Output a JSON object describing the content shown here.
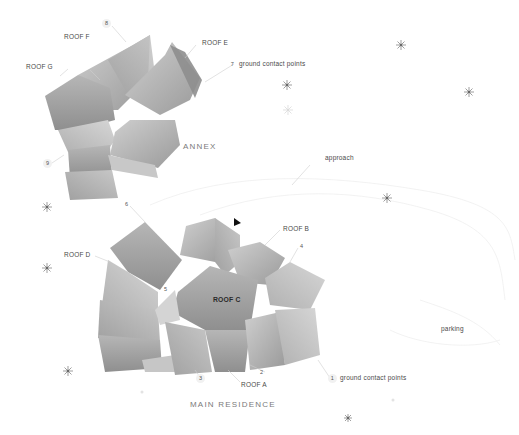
{
  "diagram": {
    "type": "architectural site plan",
    "groups": [
      {
        "id": "annex",
        "title": "ANNEX"
      },
      {
        "id": "main",
        "title": "MAIN RESIDENCE"
      }
    ],
    "roof_labels": {
      "roof_a": "ROOF A",
      "roof_b": "ROOF B",
      "roof_c": "ROOF C",
      "roof_d": "ROOF D",
      "roof_e": "ROOF E",
      "roof_f": "ROOF F",
      "roof_g": "ROOF G"
    },
    "annotations": {
      "ground_contact_annex": "ground contact points",
      "ground_contact_main": "ground contact points",
      "approach": "approach",
      "parking": "parking"
    },
    "point_numbers": {
      "p1": "1",
      "p2": "2",
      "p3": "3",
      "p4": "4",
      "p5": "5",
      "p6": "6",
      "p7": "7",
      "p8": "8",
      "p9": "9"
    },
    "colors": {
      "roof_light": "#c4c4c4",
      "roof_mid": "#a9a9a9",
      "roof_dark": "#8c8c8c",
      "leader_line": "#d0d0d0",
      "tree_symbol": "#6a6a6a",
      "north_arrow": "#111111"
    }
  }
}
